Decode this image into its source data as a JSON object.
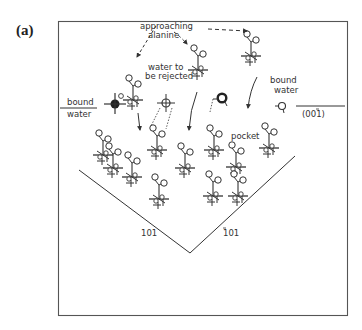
{
  "panel_label": "(a)",
  "labels": {
    "approaching_1": "approaching",
    "approaching_2": "alanine",
    "water_rejected_1": "water to",
    "water_rejected_2": "be rejected",
    "bound_water_left_1": "bound",
    "bound_water_left_2": "water",
    "bound_water_right_1": "bound",
    "bound_water_right_2": "water",
    "pocket": "pocket",
    "face_001": "(001)",
    "face_101_left": "101",
    "face_101_right": "101"
  },
  "colors": {
    "ink": "#333333",
    "frame": "#555555",
    "background": "#ffffff"
  }
}
